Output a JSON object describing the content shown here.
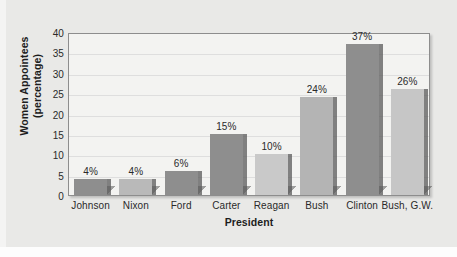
{
  "chart_data": {
    "type": "bar",
    "title": "",
    "xlabel": "President",
    "ylabel": "Women Appointees (percentage)",
    "ylabel_line1": "Women Appointees",
    "ylabel_line2": "(percentage)",
    "categories": [
      "Johnson",
      "Nixon",
      "Ford",
      "Carter",
      "Reagan",
      "Bush",
      "Clinton",
      "Bush, G.W."
    ],
    "values": [
      4,
      4,
      6,
      15,
      10,
      24,
      37,
      26
    ],
    "data_labels": [
      "4%",
      "4%",
      "6%",
      "15%",
      "10%",
      "24%",
      "37%",
      "26%"
    ],
    "bar_colors": [
      "#8e8e8e",
      "#b9b9b9",
      "#8e8e8e",
      "#8e8e8e",
      "#c9c9c9",
      "#b4b4b4",
      "#8e8e8e",
      "#c6c6c6"
    ],
    "ylim": [
      0,
      40
    ],
    "ytick_values": [
      40,
      35,
      30,
      25,
      20,
      15,
      10,
      5,
      0
    ],
    "ytick_labels": [
      "40",
      "35",
      "30",
      "25",
      "20",
      "15",
      "10",
      "5",
      "0"
    ],
    "grid": true,
    "grid_axis": "y",
    "legend": false,
    "legend_position": "none",
    "plot_background": "#f3f3f1",
    "canvas_background": "#e9e9e7",
    "axis_color": "#8d8d8d",
    "gridline_color": "#dedede",
    "text_color": "#2a2a2a"
  }
}
